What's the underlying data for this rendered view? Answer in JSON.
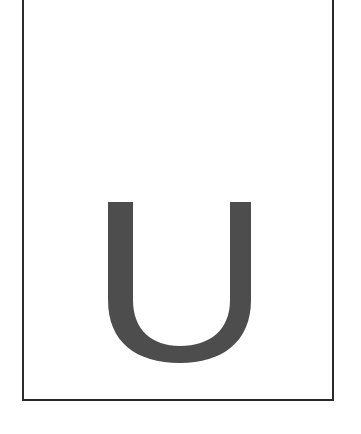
{
  "page": {
    "letter": "U",
    "letter_color": "#4d4d4d",
    "frame_color": "#2a2a2a",
    "background": "#ffffff"
  }
}
